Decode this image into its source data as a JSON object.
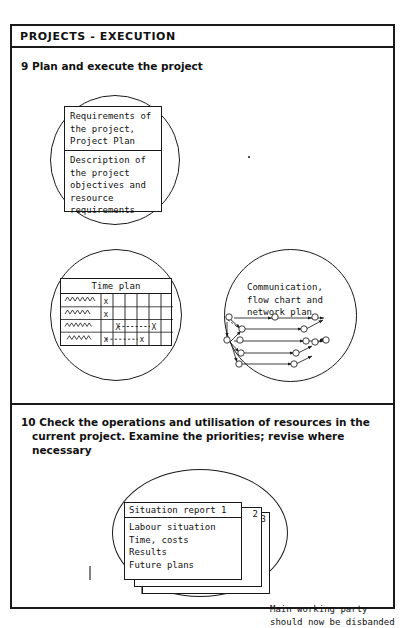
{
  "page": {
    "header_title": "PROJECTS - EXECUTION"
  },
  "steps": [
    {
      "number": "9",
      "text": "9 Plan and execute the project"
    },
    {
      "number": "10",
      "text": "10 Check the operations and utilisation of resources in the\n   current project. Examine the priorities; revise where\n   necessary"
    }
  ],
  "requirements_circle": {
    "name": "requirements-circle",
    "cell_1": "Requirements of\nthe project,\nProject Plan",
    "cell_2": "Description of\nthe project\nobjectives and\nresource\nrequirements"
  },
  "time_plan_circle": {
    "name": "time-plan-circle",
    "table_title": "Time plan",
    "row_count": 4,
    "column_count": 6,
    "marks": [
      {
        "row": 1,
        "col": 1,
        "label": "x"
      },
      {
        "row": 2,
        "col": 1,
        "label": "x"
      },
      {
        "row": 3,
        "col": 2,
        "label": "X"
      },
      {
        "row": 3,
        "col": 5,
        "label": "X"
      },
      {
        "row": 4,
        "col": 1,
        "label": "x"
      },
      {
        "row": 4,
        "col": 4,
        "label": "x"
      }
    ]
  },
  "network_circle": {
    "name": "network-circle",
    "label": "Communication,\nflow chart and\nnetwork plan"
  },
  "situation_reports": {
    "card_1_title": "Situation report 1",
    "card_1_lines": "Labour situation\nTime, costs\nResults\nFuture plans",
    "card_2_number": "2",
    "card_3_number": "3"
  },
  "disband_note": "Main working party\nshould now be disbanded",
  "colors": {
    "ink": "#1a1a1a",
    "paper": "#ffffff"
  }
}
